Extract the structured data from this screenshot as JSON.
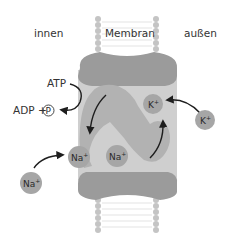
{
  "labels": {
    "inside": "innen",
    "membrane": "Membran",
    "outside": "außen"
  },
  "reaction": {
    "atp": "ATP",
    "adp": "ADP +",
    "phosphate": "P"
  },
  "ions": {
    "k_inside": {
      "base": "K",
      "charge": "+"
    },
    "k_outside": {
      "base": "K",
      "charge": "+"
    },
    "na_outside": {
      "base": "Na",
      "charge": "+"
    },
    "na_inside_1": {
      "base": "Na",
      "charge": "+"
    },
    "na_inside_2": {
      "base": "Na",
      "charge": "+"
    }
  },
  "colors": {
    "protein_dark": "#9a9a9a",
    "protein_mid": "#b5b5b5",
    "protein_light": "#d0d0d0",
    "ion": "#a6a6a6",
    "lipid": "#bdbdbd",
    "arrow": "#1e1e1e"
  }
}
